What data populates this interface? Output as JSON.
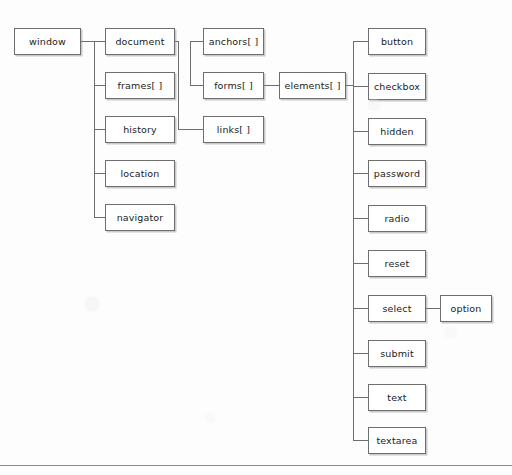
{
  "diagram": {
    "type": "tree",
    "style": {
      "background": "#fdfdfd",
      "node_fill": "#ffffff",
      "node_border": "#6e6e6e",
      "edge_color": "#6e6e6e",
      "text_color": "#1b1b1b",
      "rule_color": "#8a8a8a"
    },
    "nodes": [
      {
        "id": "window",
        "label": "window",
        "x": 14,
        "y": 28,
        "w": 67,
        "h": 27
      },
      {
        "id": "document",
        "label": "document",
        "x": 105,
        "y": 28,
        "w": 70,
        "h": 27
      },
      {
        "id": "frames",
        "label": "frames[ ]",
        "x": 105,
        "y": 72,
        "w": 70,
        "h": 27
      },
      {
        "id": "history",
        "label": "history",
        "x": 105,
        "y": 116,
        "w": 70,
        "h": 27
      },
      {
        "id": "location",
        "label": "location",
        "x": 105,
        "y": 160,
        "w": 70,
        "h": 27
      },
      {
        "id": "navigator",
        "label": "navigator",
        "x": 105,
        "y": 204,
        "w": 70,
        "h": 27
      },
      {
        "id": "anchors",
        "label": "anchors[ ]",
        "x": 203,
        "y": 28,
        "w": 61,
        "h": 27
      },
      {
        "id": "forms",
        "label": "forms[ ]",
        "x": 203,
        "y": 72,
        "w": 61,
        "h": 27
      },
      {
        "id": "links",
        "label": "links[ ]",
        "x": 203,
        "y": 116,
        "w": 61,
        "h": 27
      },
      {
        "id": "elements",
        "label": "elements[ ]",
        "x": 279,
        "y": 72,
        "w": 67,
        "h": 27
      },
      {
        "id": "button",
        "label": "button",
        "x": 368,
        "y": 28,
        "w": 58,
        "h": 27
      },
      {
        "id": "checkbox",
        "label": "checkbox",
        "x": 368,
        "y": 73,
        "w": 58,
        "h": 27
      },
      {
        "id": "hidden",
        "label": "hidden",
        "x": 368,
        "y": 118,
        "w": 58,
        "h": 27
      },
      {
        "id": "password",
        "label": "password",
        "x": 368,
        "y": 160,
        "w": 58,
        "h": 27
      },
      {
        "id": "radio",
        "label": "radio",
        "x": 368,
        "y": 205,
        "w": 58,
        "h": 27
      },
      {
        "id": "reset",
        "label": "reset",
        "x": 368,
        "y": 250,
        "w": 58,
        "h": 27
      },
      {
        "id": "select",
        "label": "select",
        "x": 368,
        "y": 295,
        "w": 58,
        "h": 27
      },
      {
        "id": "option",
        "label": "option",
        "x": 440,
        "y": 295,
        "w": 52,
        "h": 27
      },
      {
        "id": "submit",
        "label": "submit",
        "x": 368,
        "y": 340,
        "w": 58,
        "h": 27
      },
      {
        "id": "text",
        "label": "text",
        "x": 368,
        "y": 384,
        "w": 58,
        "h": 27
      },
      {
        "id": "textarea",
        "label": "textarea",
        "x": 368,
        "y": 427,
        "w": 58,
        "h": 27
      }
    ],
    "edges": [
      {
        "from": "window",
        "to": "document"
      },
      {
        "from": "window",
        "to": "frames"
      },
      {
        "from": "window",
        "to": "history"
      },
      {
        "from": "window",
        "to": "location"
      },
      {
        "from": "window",
        "to": "navigator"
      },
      {
        "from": "document",
        "to": "anchors"
      },
      {
        "from": "document",
        "to": "forms"
      },
      {
        "from": "document",
        "to": "links"
      },
      {
        "from": "forms",
        "to": "elements"
      },
      {
        "from": "elements",
        "to": "button"
      },
      {
        "from": "elements",
        "to": "checkbox"
      },
      {
        "from": "elements",
        "to": "hidden"
      },
      {
        "from": "elements",
        "to": "password"
      },
      {
        "from": "elements",
        "to": "radio"
      },
      {
        "from": "elements",
        "to": "reset"
      },
      {
        "from": "elements",
        "to": "select"
      },
      {
        "from": "elements",
        "to": "submit"
      },
      {
        "from": "elements",
        "to": "text"
      },
      {
        "from": "elements",
        "to": "textarea"
      },
      {
        "from": "select",
        "to": "option"
      }
    ],
    "rule": {
      "y": 465
    }
  }
}
